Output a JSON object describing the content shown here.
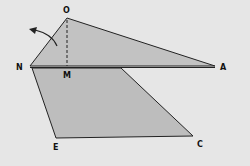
{
  "diagram": {
    "background": "#e6e6e6",
    "fill": "#bdbdbd",
    "stroke": "#222222",
    "labels": {
      "O": "O",
      "N": "N",
      "M": "M",
      "A": "A",
      "E": "E",
      "C": "C"
    },
    "points": {
      "O": [
        67,
        18
      ],
      "N": [
        30,
        66
      ],
      "M": [
        67,
        66
      ],
      "A": [
        215,
        66
      ],
      "E": [
        56,
        138
      ],
      "C": [
        193,
        136
      ]
    }
  }
}
